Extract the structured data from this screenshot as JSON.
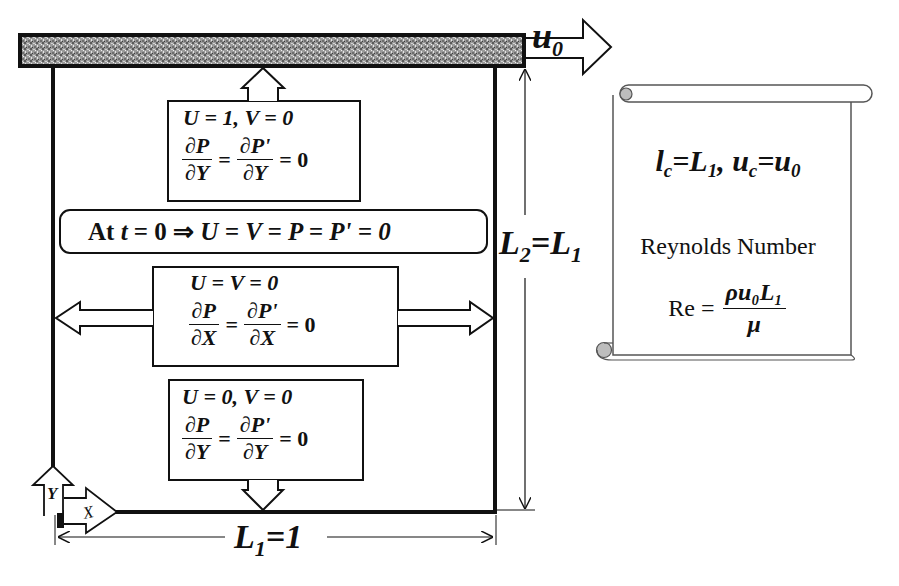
{
  "lid": {
    "velocity_label": "u",
    "velocity_subscript": "0"
  },
  "top_boundary": {
    "line1": "U = 1, V = 0",
    "frac1_num": "∂P",
    "frac1_den": "∂Y",
    "frac2_num": "∂P'",
    "frac2_den": "∂Y",
    "equals": "=",
    "result": "= 0"
  },
  "initial_condition": {
    "text_prefix": "At ",
    "t": "t",
    "text_rest": " = 0 ⇒ ",
    "expr": "U = V = P = P' = 0"
  },
  "side_boundaries": {
    "line1": "U = V = 0",
    "frac1_num": "∂P",
    "frac1_den": "∂X",
    "frac2_num": "∂P'",
    "frac2_den": "∂X",
    "equals": "=",
    "result": "= 0"
  },
  "bottom_boundary": {
    "line1": "U = 0, V = 0",
    "frac1_num": "∂P",
    "frac1_den": "∂Y",
    "frac2_num": "∂P'",
    "frac2_den": "∂Y",
    "equals": "=",
    "result": "= 0"
  },
  "axes": {
    "y_label": "Y",
    "x_label": "X"
  },
  "dimensions": {
    "width_label_main": "L",
    "width_label_sub": "1",
    "width_label_rest": "=1",
    "height_label_main": "L",
    "height_label_sub": "2",
    "height_label_eq": "=L",
    "height_label_sub2": "1"
  },
  "scroll": {
    "char_length_l": "l",
    "char_length_sub": "c",
    "char_length_eq": "=L",
    "char_length_eq_sub": "1",
    "char_vel_sep": ", ",
    "char_vel_u": "u",
    "char_vel_sub": "c",
    "char_vel_eq": "=u",
    "char_vel_eq_sub": "0",
    "reynolds_title": "Reynolds Number",
    "re_lhs": "Re =",
    "re_num": "ρu₀L₁",
    "re_den": "μ"
  },
  "colors": {
    "line": "#111111",
    "lid_fill": "#8a8a8a",
    "scroll_fill": "#ffffff",
    "scroll_curl": "#bdbdbd"
  }
}
